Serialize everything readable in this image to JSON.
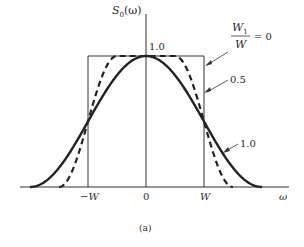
{
  "chart_data": {
    "type": "line",
    "title": "",
    "xlabel": "ω",
    "ylabel": "S₀(ω)",
    "caption": "(a)",
    "x_ticks": [
      "−W",
      "0",
      "W"
    ],
    "y_ticks": [
      "1.0"
    ],
    "xlim": [
      -2.5,
      2.5
    ],
    "ylim": [
      0,
      1.0
    ],
    "x_units": "W",
    "grid": false,
    "legend_position": "inline annotations with arrows, right side",
    "annotation_header": "W₁/W",
    "series": [
      {
        "name": "W₁/W = 0",
        "rolloff": 0,
        "style": "thin solid (rectangle)",
        "x": [
          -1.0,
          -1.0,
          1.0,
          1.0
        ],
        "y": [
          0.0,
          1.0,
          1.0,
          0.0
        ]
      },
      {
        "name": "0.5",
        "rolloff": 0.5,
        "style": "dashed",
        "x": [
          -1.5,
          -1.25,
          -1.0,
          -0.75,
          -0.5,
          0,
          0.5,
          0.75,
          1.0,
          1.25,
          1.5
        ],
        "y": [
          0.0,
          0.146,
          0.5,
          0.854,
          1.0,
          1.0,
          1.0,
          0.854,
          0.5,
          0.146,
          0.0
        ]
      },
      {
        "name": "1.0",
        "rolloff": 1.0,
        "style": "thick solid",
        "x": [
          -2.0,
          -1.5,
          -1.0,
          -0.5,
          0,
          0.5,
          1.0,
          1.5,
          2.0
        ],
        "y": [
          0.0,
          0.146,
          0.5,
          0.854,
          1.0,
          0.854,
          0.5,
          0.146,
          0.0
        ]
      }
    ]
  },
  "labels": {
    "ylabel_main": "S",
    "ylabel_sub": "0",
    "ylabel_arg": "(ω)",
    "xlabel": "ω",
    "y_tick_top": "1.0",
    "x_tick_neg": "−W",
    "x_tick_zero": "0",
    "x_tick_pos": "W",
    "anno_frac_num": "W",
    "anno_frac_num_sub": "1",
    "anno_frac_den": "W",
    "anno_frac_eq": "= 0",
    "anno_half": "0.5",
    "anno_one": "1.0",
    "caption": "(a)"
  },
  "colors": {
    "ink": "#222222",
    "background": "#ffffff"
  }
}
